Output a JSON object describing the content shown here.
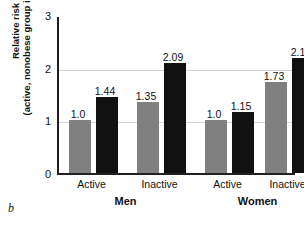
{
  "panel": {
    "letter": "b"
  },
  "chart_data": {
    "type": "bar",
    "title": "",
    "xlabel": "",
    "ylabel": "Relative risk (active, nonobese group is reference)",
    "ylabel_line1": "Relative risk",
    "ylabel_line2": "(active, nonobese group is reference)",
    "ylim": [
      0,
      3
    ],
    "yticks": [
      0,
      1,
      2,
      3
    ],
    "ytick_labels": [
      "0",
      "1",
      "2",
      "3"
    ],
    "grid": true,
    "gridlines": [
      1,
      2
    ],
    "legend_position": "none",
    "categories": [
      "Active",
      "Inactive",
      "Active",
      "Inactive"
    ],
    "groups": [
      {
        "name": "Men",
        "categories": [
          "Active",
          "Inactive"
        ]
      },
      {
        "name": "Women",
        "categories": [
          "Active",
          "Inactive"
        ]
      }
    ],
    "series": [
      {
        "name": "Nonobese",
        "color": "#808080",
        "values": [
          1.0,
          1.35,
          1.0,
          1.73
        ]
      },
      {
        "name": "Obese",
        "color": "#111111",
        "values": [
          1.44,
          2.09,
          1.15,
          2.18
        ]
      }
    ],
    "bars": [
      {
        "group": "Men",
        "category": "Active",
        "series": "Nonobese",
        "value": 1.0,
        "label": "1.0",
        "color": "#808080"
      },
      {
        "group": "Men",
        "category": "Active",
        "series": "Obese",
        "value": 1.44,
        "label": "1.44",
        "color": "#111111"
      },
      {
        "group": "Men",
        "category": "Inactive",
        "series": "Nonobese",
        "value": 1.35,
        "label": "1.35",
        "color": "#808080"
      },
      {
        "group": "Men",
        "category": "Inactive",
        "series": "Obese",
        "value": 2.09,
        "label": "2.09",
        "color": "#111111"
      },
      {
        "group": "Women",
        "category": "Active",
        "series": "Nonobese",
        "value": 1.0,
        "label": "1.0",
        "color": "#808080"
      },
      {
        "group": "Women",
        "category": "Active",
        "series": "Obese",
        "value": 1.15,
        "label": "1.15",
        "color": "#111111"
      },
      {
        "group": "Women",
        "category": "Inactive",
        "series": "Nonobese",
        "value": 1.73,
        "label": "1.73",
        "color": "#808080"
      },
      {
        "group": "Women",
        "category": "Inactive",
        "series": "Obese",
        "value": 2.18,
        "label": "2.18",
        "color": "#111111"
      }
    ],
    "colors": {
      "nonobese": "#808080",
      "obese": "#111111",
      "axis": "#231f20",
      "grid": "#d2d2d2",
      "text": "#111111",
      "background": "#ffffff"
    }
  }
}
